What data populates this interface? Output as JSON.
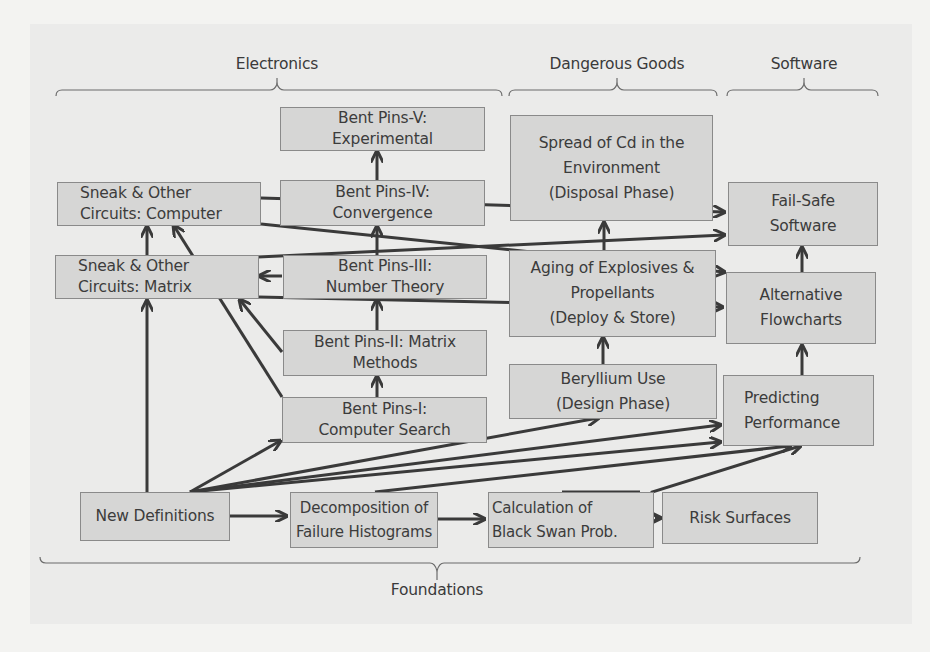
{
  "categories": {
    "electronics": "Electronics",
    "dangerous_goods": "Dangerous Goods",
    "software": "Software",
    "foundations": "Foundations"
  },
  "nodes": {
    "sneak_computer": [
      "Sneak & Other",
      "Circuits: Computer"
    ],
    "sneak_matrix": [
      "Sneak & Other",
      "Circuits: Matrix"
    ],
    "bent_v": [
      "Bent Pins-V:",
      "Experimental"
    ],
    "bent_iv": [
      "Bent Pins-IV:",
      "Convergence"
    ],
    "bent_iii": [
      "Bent Pins-III:",
      "Number Theory"
    ],
    "bent_ii": [
      "Bent Pins-II: Matrix",
      "Methods"
    ],
    "bent_i": [
      "Bent Pins-I:",
      "Computer Search"
    ],
    "cd_spread": [
      "Spread of Cd in the",
      "Environment",
      "(Disposal Phase)"
    ],
    "aging": [
      "Aging of Explosives &",
      "Propellants",
      "(Deploy & Store)"
    ],
    "beryllium": [
      "Beryllium Use",
      "(Design Phase)"
    ],
    "fail_safe": [
      "Fail-Safe",
      "Software"
    ],
    "alt_flowcharts": [
      "Alternative",
      "Flowcharts"
    ],
    "predicting": [
      "Predicting",
      "Performance"
    ],
    "new_defs": [
      "New Definitions"
    ],
    "decomposition": [
      "Decomposition of",
      "Failure Histograms"
    ],
    "black_swan": [
      "Calculation of",
      "Black Swan Prob."
    ],
    "risk_surfaces": [
      "Risk Surfaces"
    ]
  },
  "edges": [
    [
      "new_defs",
      "decomposition"
    ],
    [
      "decomposition",
      "black_swan"
    ],
    [
      "black_swan",
      "risk_surfaces"
    ],
    [
      "new_defs",
      "sneak_matrix"
    ],
    [
      "new_defs",
      "bent_i"
    ],
    [
      "new_defs",
      "beryllium"
    ],
    [
      "new_defs",
      "predicting"
    ],
    [
      "decomposition",
      "predicting"
    ],
    [
      "black_swan",
      "predicting"
    ],
    [
      "sneak_matrix",
      "sneak_computer"
    ],
    [
      "bent_i",
      "sneak_computer"
    ],
    [
      "bent_ii",
      "sneak_matrix"
    ],
    [
      "bent_iii",
      "sneak_matrix"
    ],
    [
      "bent_i",
      "bent_ii"
    ],
    [
      "bent_ii",
      "bent_iii"
    ],
    [
      "bent_iii",
      "bent_iv"
    ],
    [
      "bent_iv",
      "bent_v"
    ],
    [
      "sneak_computer",
      "fail_safe"
    ],
    [
      "sneak_computer",
      "alt_flowcharts"
    ],
    [
      "sneak_matrix",
      "fail_safe"
    ],
    [
      "sneak_matrix",
      "alt_flowcharts"
    ],
    [
      "beryllium",
      "aging"
    ],
    [
      "aging",
      "cd_spread"
    ],
    [
      "predicting",
      "alt_flowcharts"
    ],
    [
      "alt_flowcharts",
      "fail_safe"
    ]
  ]
}
